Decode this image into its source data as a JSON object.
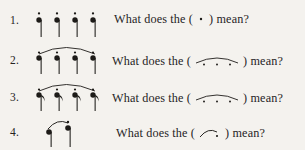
{
  "page": {
    "background_color": "#f4f2ee",
    "ink_color": "#1d1b18",
    "worksheet_type": "music-notation-questions"
  },
  "questions": [
    {
      "number": "1.",
      "notation": {
        "name": "four-quarter-notes-with-staccato-dots",
        "note_count": 4,
        "note_type": "quarter",
        "stem_direction": "down",
        "articulation": "staccato",
        "slur": false
      },
      "text_before": "What does the (",
      "symbol": {
        "name": "staccato-dot-symbol",
        "glyph": "·",
        "description": "single dot"
      },
      "text_after": ") mean?"
    },
    {
      "number": "2.",
      "notation": {
        "name": "four-quarter-notes-with-staccato-dots-under-slur",
        "note_count": 4,
        "note_type": "quarter",
        "stem_direction": "down",
        "articulation": "staccato",
        "slur": true
      },
      "text_before": "What does the (",
      "symbol": {
        "name": "slur-with-dots-symbol",
        "glyph": "",
        "description": "curved slur line with dots beneath"
      },
      "text_after": ") mean?"
    },
    {
      "number": "3.",
      "notation": {
        "name": "four-eighth-notes-with-staccato-dots-under-slur",
        "note_count": 4,
        "note_type": "eighth",
        "stem_direction": "down",
        "articulation": "staccato",
        "slur": true
      },
      "text_before": "What does the (",
      "symbol": {
        "name": "slur-with-dots-symbol",
        "glyph": "",
        "description": "curved slur line with dots beneath"
      },
      "text_after": ") mean?"
    },
    {
      "number": "4.",
      "notation": {
        "name": "two-notes-slur-with-staccato-on-second",
        "note_count": 2,
        "note_type": "quarter",
        "stem_direction": "down",
        "articulation": "staccato-on-second",
        "slur": true
      },
      "text_before": "What does the (",
      "symbol": {
        "name": "short-slur-with-dot-symbol",
        "glyph": "",
        "description": "short rising curve ending in a dot"
      },
      "text_after": ") mean?"
    }
  ]
}
